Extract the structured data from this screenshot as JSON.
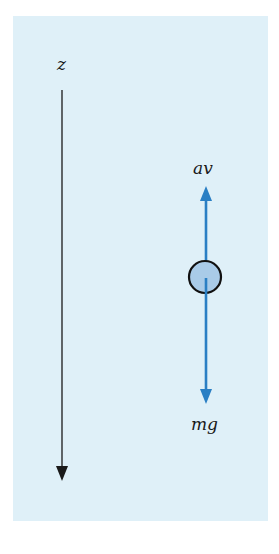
{
  "diagram": {
    "axis": {
      "label": "z",
      "direction": "down"
    },
    "forces": [
      {
        "label": "av",
        "direction": "up",
        "color": "#2a7fc4"
      },
      {
        "label": "mg",
        "direction": "down",
        "color": "#2a7fc4"
      }
    ],
    "body": {
      "shape": "circle",
      "fill": "#a9cbe8",
      "stroke": "#111111"
    },
    "colors": {
      "background": "#dff0f8",
      "axis": "#1a1a1a",
      "arrow": "#2a7fc4"
    }
  }
}
